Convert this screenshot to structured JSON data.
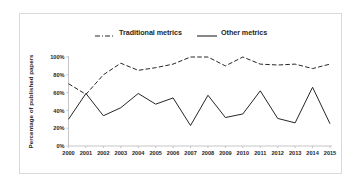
{
  "chart_data": {
    "type": "line",
    "title": "",
    "xlabel": "",
    "ylabel": "Percentage of published papers",
    "ylim": [
      0,
      100
    ],
    "ytick_labels": [
      "0%",
      "20%",
      "40%",
      "60%",
      "80%",
      "100%"
    ],
    "ytick_values": [
      0,
      20,
      40,
      60,
      80,
      100
    ],
    "grid": false,
    "legend_position": "top",
    "categories": [
      "2000",
      "2001",
      "2002",
      "2003",
      "2004",
      "2005",
      "2006",
      "2007",
      "2008",
      "2009",
      "2010",
      "2011",
      "2012",
      "2013",
      "2014",
      "2015"
    ],
    "series": [
      {
        "name": "Traditional metrics",
        "style": "dashed",
        "color": "#262626",
        "values": [
          70,
          58,
          80,
          93,
          85,
          88,
          92,
          100,
          100,
          90,
          100,
          92,
          91,
          92,
          87,
          92
        ]
      },
      {
        "name": "Other metrics",
        "style": "solid",
        "color": "#262626",
        "values": [
          30,
          59,
          34,
          43,
          59,
          47,
          54,
          23,
          57,
          32,
          36,
          62,
          31,
          26,
          66,
          25
        ]
      }
    ]
  },
  "legend": {
    "traditional_label": "Traditional metrics",
    "other_label": "Other metrics"
  },
  "axis": {
    "y_title": "Percentage of published papers"
  },
  "colors": {
    "line": "#262626",
    "axis": "#bfbfbf",
    "frame": "#d9d9d9",
    "background": "#ffffff"
  }
}
